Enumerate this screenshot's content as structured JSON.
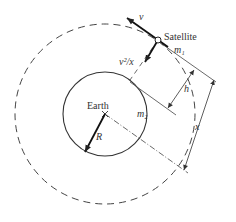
{
  "diagram": {
    "labels": {
      "satellite": "Satellite",
      "earth": "Earth",
      "velocity": "v",
      "centripetal": "v²/x",
      "mass_satellite": "m₁",
      "mass_earth": "m₂",
      "radius": "R",
      "altitude": "h",
      "orbit_radius": "x"
    },
    "elements": {
      "earth_circle": "solid circle",
      "orbit_path": "dashed circle",
      "radius_arrow": "arrow from Earth center",
      "velocity_arrow": "tangent arrow at satellite",
      "acceleration_arrow": "arrow toward Earth center",
      "altitude_dimension": "h",
      "orbit_dimension": "x"
    },
    "colors": {
      "line": "#333333",
      "background": "#ffffff"
    }
  }
}
